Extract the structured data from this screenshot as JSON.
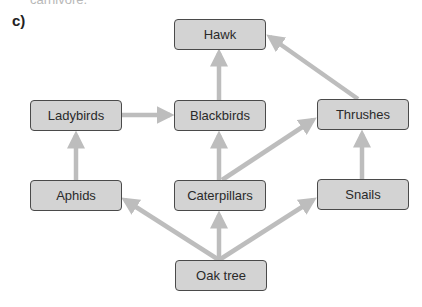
{
  "header": {
    "cut_text": "carnivore.",
    "label": "c)"
  },
  "nodes": {
    "hawk": "Hawk",
    "ladybirds": "Ladybirds",
    "blackbirds": "Blackbirds",
    "thrushes": "Thrushes",
    "aphids": "Aphids",
    "caterpillars": "Caterpillars",
    "snails": "Snails",
    "oak_tree": "Oak tree"
  },
  "edges": [
    {
      "from": "Oak tree",
      "to": "Aphids"
    },
    {
      "from": "Oak tree",
      "to": "Caterpillars"
    },
    {
      "from": "Oak tree",
      "to": "Snails"
    },
    {
      "from": "Aphids",
      "to": "Ladybirds"
    },
    {
      "from": "Ladybirds",
      "to": "Blackbirds"
    },
    {
      "from": "Caterpillars",
      "to": "Blackbirds"
    },
    {
      "from": "Caterpillars",
      "to": "Thrushes"
    },
    {
      "from": "Snails",
      "to": "Thrushes"
    },
    {
      "from": "Blackbirds",
      "to": "Hawk"
    },
    {
      "from": "Thrushes",
      "to": "Hawk"
    }
  ],
  "colors": {
    "node_fill": "#d3d3d3",
    "node_border": "#4a4a4a",
    "arrow": "#bdbdbd"
  }
}
